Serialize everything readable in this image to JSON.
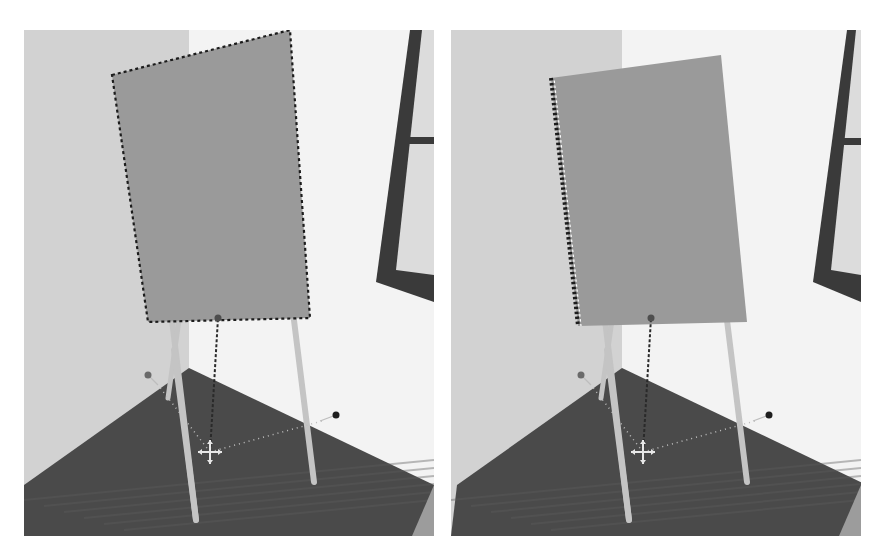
{
  "figure": {
    "panels": [
      {
        "id": "left",
        "outline_mode": "full-dashed",
        "board": [
          [
            88,
            45
          ],
          [
            266,
            0
          ],
          [
            286,
            288
          ],
          [
            124,
            292
          ]
        ],
        "window": {
          "outer": [
            [
              386,
              0
            ],
            [
              410,
              0
            ],
            [
              410,
              272
            ],
            [
              352,
              252
            ]
          ],
          "inner": [
            [
              398,
              0
            ],
            [
              410,
              0
            ],
            [
              410,
              245
            ],
            [
              372,
              240
            ]
          ],
          "mullion_y": 107
        }
      },
      {
        "id": "right",
        "outline_mode": "left-edge-dashed",
        "board": [
          [
            100,
            48
          ],
          [
            270,
            25
          ],
          [
            296,
            292
          ],
          [
            127,
            296
          ]
        ],
        "window": {
          "outer": [
            [
              396,
              0
            ],
            [
              410,
              0
            ],
            [
              410,
              272
            ],
            [
              362,
              252
            ]
          ],
          "inner": [
            [
              405,
              0
            ],
            [
              410,
              0
            ],
            [
              410,
              245
            ],
            [
              380,
              240
            ]
          ],
          "mullion_y": 108
        }
      }
    ],
    "scene": {
      "colors": {
        "wall_left": "#d2d2d2",
        "wall_back": "#f3f3f3",
        "floor": "#4a4a4a",
        "floor_light": "#5c5c5c",
        "board": "#9a9a9a",
        "board_edge": "#7f7f7f",
        "outline": "#1c1c1c",
        "legs": "#c4c4c4",
        "window_frame": "#3a3a3a",
        "window_glass": "#dcdcdc",
        "gizmo_handle": "#4e4e4e",
        "gizmo_dash": "#2a2a2a",
        "gizmo_dot": "#bdbdbd",
        "move_cursor": "#e8e8e8"
      },
      "wall_left_right_edge": 165,
      "floor": [
        [
          0,
          455
        ],
        [
          165,
          338
        ],
        [
          410,
          455
        ],
        [
          410,
          506
        ],
        [
          0,
          506
        ]
      ],
      "floor_far_edge": [
        [
          0,
          455
        ],
        [
          165,
          338
        ],
        [
          410,
          455
        ]
      ],
      "legs": [
        {
          "from": [
            148,
            290
          ],
          "to": [
            172,
            490
          ],
          "w": 6
        },
        {
          "from": [
            266,
            258
          ],
          "to": [
            290,
            452
          ],
          "w": 6
        },
        {
          "from": [
            155,
            290
          ],
          "to": [
            144,
            368
          ],
          "w": 5
        }
      ],
      "gizmo": {
        "center": [
          186,
          422
        ],
        "up_handle": [
          194,
          288
        ],
        "left_handle": [
          124,
          345
        ],
        "right_handle": [
          312,
          385
        ]
      }
    }
  }
}
